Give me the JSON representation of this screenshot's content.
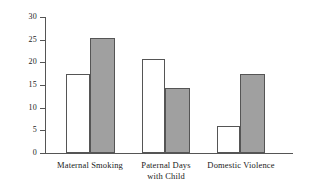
{
  "chart_data": {
    "type": "bar",
    "title": "",
    "subtitle": "",
    "xlabel": "",
    "ylabel": "",
    "categories": [
      "Maternal Smoking",
      "Paternal Days\nwith Child",
      "Domestic Violence"
    ],
    "series": [
      {
        "name": "open",
        "style": "white-open-bar",
        "values": [
          17.5,
          20.7,
          5.9
        ]
      },
      {
        "name": "filled",
        "style": "gray-filled-bar",
        "values": [
          25.3,
          14.3,
          17.5
        ]
      }
    ],
    "ylim": [
      0,
      30
    ],
    "yticks": [
      0,
      5,
      10,
      15,
      20,
      25,
      30
    ],
    "ytick_labels": [
      "0",
      "5",
      "10",
      "15",
      "20",
      "25",
      "30"
    ],
    "grid": false,
    "legend": "none",
    "colors": {
      "open_bar_fill": "#ffffff",
      "filled_bar_fill": "#a0a0a0",
      "bar_outline": "#555555",
      "axis": "#555555",
      "text": "#1a1a1a",
      "background": "#ffffff"
    },
    "group_geometry": [
      {
        "open_left": 66,
        "open_width": 24,
        "filled_left": 90,
        "filled_width": 25,
        "label_center": 90
      },
      {
        "open_left": 142,
        "open_width": 23,
        "filled_left": 165,
        "filled_width": 25,
        "label_center": 166
      },
      {
        "open_left": 217,
        "open_width": 23,
        "filled_left": 240,
        "filled_width": 25,
        "label_center": 241
      }
    ]
  }
}
